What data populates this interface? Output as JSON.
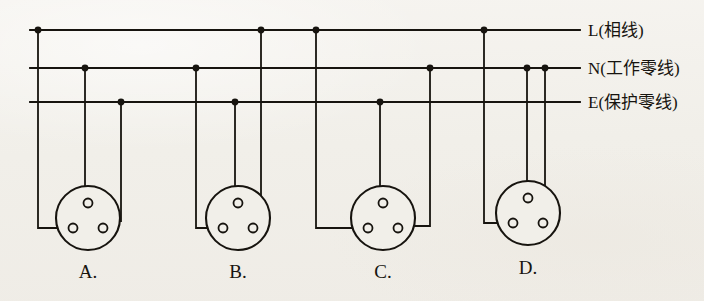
{
  "figure": {
    "kind": "electrical-wiring-diagram",
    "background_color": "#f1efe9",
    "ink_color": "#17140f",
    "line_width": 1.8
  },
  "bus_lines": [
    {
      "id": "L",
      "label": "L(相线)",
      "letter": "L",
      "chinese": "(相线)",
      "meaning_label": "live-line",
      "y": 30,
      "x_start": 30,
      "x_end": 580,
      "label_x": 588,
      "junction_dots_x": [
        38,
        261,
        316,
        484
      ]
    },
    {
      "id": "N",
      "label": "N(工作零线)",
      "letter": "N",
      "chinese": "(工作零线)",
      "meaning_label": "neutral-working-line",
      "y": 68,
      "x_start": 30,
      "x_end": 580,
      "label_x": 588,
      "junction_dots_x": [
        85,
        196,
        430,
        527,
        545
      ]
    },
    {
      "id": "E",
      "label": "E(保护零线)",
      "letter": "E",
      "chinese": "(保护零线)",
      "meaning_label": "protective-earth-line",
      "y": 102,
      "x_start": 30,
      "x_end": 580,
      "label_x": 588,
      "junction_dots_x": [
        121,
        235,
        380
      ]
    }
  ],
  "sockets": [
    {
      "id": "A",
      "option_label": "A.",
      "label_x": 88,
      "label_y": 278,
      "center_x": 88,
      "center_y": 218,
      "radius": 32,
      "terminals": {
        "top": {
          "cx": 88,
          "cy": 203,
          "r": 4.5
        },
        "bottom_left": {
          "cx": 73,
          "cy": 228,
          "r": 4.5
        },
        "bottom_right": {
          "cx": 103,
          "cy": 228,
          "r": 4.5
        }
      },
      "connections": [
        {
          "from_bus": "L",
          "drop_x": 38,
          "to_terminal": "bottom_left",
          "elbow_y": 228
        },
        {
          "from_bus": "N",
          "drop_x": 85,
          "to_terminal": "top",
          "elbow_y": null
        },
        {
          "from_bus": "E",
          "drop_x": 121,
          "to_terminal": "bottom_right",
          "elbow_y": 221
        }
      ]
    },
    {
      "id": "B",
      "option_label": "B.",
      "label_x": 238,
      "label_y": 278,
      "center_x": 238,
      "center_y": 218,
      "radius": 32,
      "terminals": {
        "top": {
          "cx": 238,
          "cy": 203,
          "r": 4.5
        },
        "bottom_left": {
          "cx": 223,
          "cy": 228,
          "r": 4.5
        },
        "bottom_right": {
          "cx": 253,
          "cy": 228,
          "r": 4.5
        }
      },
      "connections": [
        {
          "from_bus": "N",
          "drop_x": 196,
          "to_terminal": "bottom_left",
          "elbow_y": 228
        },
        {
          "from_bus": "E",
          "drop_x": 235,
          "to_terminal": "top",
          "elbow_y": null
        },
        {
          "from_bus": "L",
          "drop_x": 261,
          "to_terminal": "bottom_right",
          "elbow_y": 226
        }
      ]
    },
    {
      "id": "C",
      "option_label": "C.",
      "label_x": 383,
      "label_y": 278,
      "center_x": 383,
      "center_y": 218,
      "radius": 32,
      "terminals": {
        "top": {
          "cx": 383,
          "cy": 203,
          "r": 4.5
        },
        "bottom_left": {
          "cx": 368,
          "cy": 228,
          "r": 4.5
        },
        "bottom_right": {
          "cx": 398,
          "cy": 228,
          "r": 4.5
        }
      },
      "connections": [
        {
          "from_bus": "L",
          "drop_x": 316,
          "to_terminal": "bottom_left",
          "elbow_y": 228
        },
        {
          "from_bus": "E",
          "drop_x": 380,
          "to_terminal": "top",
          "elbow_y": null
        },
        {
          "from_bus": "N",
          "drop_x": 430,
          "to_terminal": "bottom_right",
          "elbow_y": 226
        }
      ]
    },
    {
      "id": "D",
      "option_label": "D.",
      "label_x": 528,
      "label_y": 274,
      "center_x": 528,
      "center_y": 213,
      "radius": 32,
      "terminals": {
        "top": {
          "cx": 528,
          "cy": 198,
          "r": 4.5
        },
        "bottom_left": {
          "cx": 513,
          "cy": 223,
          "r": 4.5
        },
        "bottom_right": {
          "cx": 543,
          "cy": 223,
          "r": 4.5
        }
      },
      "connections": [
        {
          "from_bus": "L",
          "drop_x": 484,
          "to_terminal": "bottom_left",
          "elbow_y": 223
        },
        {
          "from_bus": "N",
          "drop_x": 527,
          "to_terminal": "top",
          "elbow_y": null
        },
        {
          "from_bus": "N",
          "drop_x": 545,
          "to_terminal": "bottom_right",
          "elbow_y": null
        }
      ]
    }
  ]
}
